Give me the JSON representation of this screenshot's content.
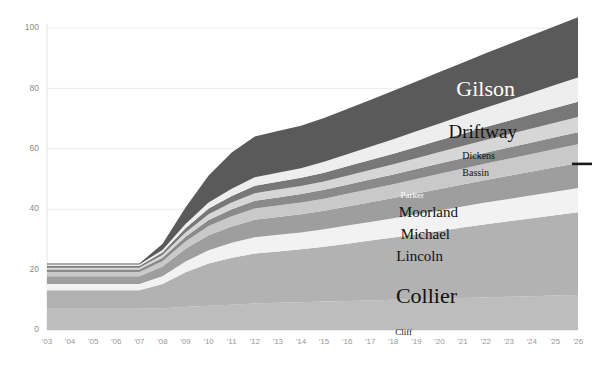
{
  "chart_data": {
    "type": "area",
    "stacked": true,
    "title": "",
    "subtitle": "",
    "xlabel": "",
    "ylabel": "",
    "grid": true,
    "legend_position": "inline-on-bands",
    "ylim": [
      0,
      100
    ],
    "yticks": [
      0,
      20,
      40,
      60,
      80,
      100
    ],
    "ytick_labels": [
      "0",
      "20",
      "40",
      "60",
      "80",
      "100"
    ],
    "categories": [
      "'03",
      "'04",
      "'05",
      "'06",
      "'07",
      "'08",
      "'09",
      "'10",
      "'11",
      "'12",
      "'13",
      "'14",
      "'15",
      "'16",
      "'17",
      "'18",
      "'19",
      "'20",
      "'21",
      "'22",
      "'23",
      "'24",
      "'25",
      "'26"
    ],
    "series": [
      {
        "name": "Cliff",
        "color": "#bdbdbd",
        "values": [
          7.0,
          7.0,
          7.0,
          7.0,
          7.0,
          7.2,
          7.6,
          8.0,
          8.4,
          8.8,
          9.0,
          9.2,
          9.4,
          9.6,
          9.8,
          10.0,
          10.2,
          10.4,
          10.6,
          10.8,
          11.0,
          11.2,
          11.4,
          11.6
        ]
      },
      {
        "name": "Collier",
        "color": "#b2b2b2",
        "values": [
          6.2,
          6.2,
          6.2,
          6.2,
          6.2,
          8.0,
          11.5,
          14.0,
          15.5,
          16.5,
          17.0,
          17.5,
          18.2,
          19.0,
          19.8,
          20.6,
          21.5,
          22.4,
          23.3,
          24.2,
          25.0,
          25.8,
          26.6,
          27.4
        ]
      },
      {
        "name": "Lincoln",
        "color": "#f2f2f2",
        "values": [
          2.0,
          2.0,
          2.0,
          2.0,
          2.0,
          2.6,
          3.6,
          4.4,
          5.0,
          5.4,
          5.5,
          5.6,
          5.8,
          6.0,
          6.2,
          6.4,
          6.6,
          6.8,
          7.0,
          7.2,
          7.4,
          7.6,
          7.8,
          8.0
        ]
      },
      {
        "name": "Michael",
        "color": "#9e9e9e",
        "values": [
          2.6,
          2.6,
          2.6,
          2.6,
          2.6,
          3.2,
          4.2,
          5.0,
          5.4,
          5.8,
          5.9,
          6.0,
          6.1,
          6.3,
          6.5,
          6.7,
          6.9,
          7.1,
          7.3,
          7.5,
          7.7,
          7.9,
          8.1,
          8.3
        ]
      },
      {
        "name": "Moorland",
        "color": "#c9c9c9",
        "values": [
          1.4,
          1.4,
          1.4,
          1.4,
          1.4,
          1.8,
          2.4,
          3.0,
          3.4,
          3.7,
          3.8,
          3.9,
          4.0,
          4.2,
          4.4,
          4.6,
          4.8,
          5.0,
          5.2,
          5.4,
          5.6,
          5.8,
          6.0,
          6.2
        ]
      },
      {
        "name": "Parker",
        "color": "#8a8a8a",
        "values": [
          0.8,
          0.8,
          0.8,
          0.8,
          0.8,
          1.1,
          1.6,
          2.0,
          2.3,
          2.6,
          2.7,
          2.8,
          2.9,
          3.0,
          3.1,
          3.2,
          3.3,
          3.4,
          3.5,
          3.6,
          3.7,
          3.8,
          3.9,
          4.0
        ]
      },
      {
        "name": "Bassin",
        "color": "#d6d6d6",
        "values": [
          0.6,
          0.6,
          0.6,
          0.6,
          0.6,
          0.9,
          1.4,
          1.9,
          2.2,
          2.5,
          2.6,
          2.7,
          2.8,
          3.0,
          3.2,
          3.4,
          3.6,
          3.8,
          4.0,
          4.2,
          4.4,
          4.6,
          4.8,
          5.0
        ]
      },
      {
        "name": "Dickens",
        "color": "#787878",
        "values": [
          0.6,
          0.6,
          0.6,
          0.6,
          0.6,
          0.9,
          1.4,
          1.9,
          2.2,
          2.5,
          2.6,
          2.7,
          2.9,
          3.1,
          3.3,
          3.5,
          3.7,
          3.9,
          4.1,
          4.3,
          4.5,
          4.7,
          4.9,
          5.1
        ]
      },
      {
        "name": "Driftway",
        "color": "#eeeeee",
        "values": [
          0.5,
          0.5,
          0.5,
          0.5,
          0.5,
          0.8,
          1.4,
          2.0,
          2.4,
          2.8,
          3.0,
          3.2,
          3.6,
          4.0,
          4.4,
          4.8,
          5.2,
          5.6,
          6.0,
          6.4,
          6.8,
          7.2,
          7.6,
          8.0
        ]
      },
      {
        "name": "Gilson",
        "color": "#5a5a5a",
        "values": [
          0.3,
          0.3,
          0.3,
          0.3,
          0.3,
          2.0,
          5.5,
          9.0,
          12.0,
          13.5,
          13.8,
          14.0,
          14.5,
          15.0,
          15.5,
          16.0,
          16.5,
          17.0,
          17.5,
          18.0,
          18.5,
          19.0,
          19.5,
          20.0
        ]
      }
    ],
    "totals": [
      22.0,
      22.0,
      22.0,
      22.0,
      22.0,
      29.5,
      41.6,
      51.2,
      58.8,
      62.1,
      63.9,
      65.6,
      68.2,
      71.2,
      74.2,
      77.2,
      80.3,
      83.4,
      86.5,
      89.6,
      92.6,
      95.6,
      98.6,
      103.6
    ],
    "annotations": [
      {
        "name": "Gilson",
        "text": "Gilson",
        "x": 515,
        "y": 96,
        "size": "lbl-huge",
        "tone": "lbl-light",
        "anchor": "end"
      },
      {
        "name": "Driftway",
        "text": "Driftway",
        "x": 517,
        "y": 138,
        "size": "lbl-big",
        "tone": "lbl-dark",
        "anchor": "end"
      },
      {
        "name": "Dickens",
        "text": "Dickens",
        "x": 495,
        "y": 159,
        "size": "lbl-small",
        "tone": "lbl-dark",
        "anchor": "end"
      },
      {
        "name": "Bassin",
        "text": "Bassin",
        "x": 489,
        "y": 176,
        "size": "lbl-small",
        "tone": "lbl-dark",
        "anchor": "end"
      },
      {
        "name": "Parker",
        "text": "Parker",
        "x": 424,
        "y": 198,
        "size": "lbl-tiny",
        "tone": "lbl-light",
        "anchor": "end"
      },
      {
        "name": "Moorland",
        "text": "Moorland",
        "x": 458,
        "y": 217,
        "size": "lbl-mid",
        "tone": "lbl-dark",
        "anchor": "end"
      },
      {
        "name": "Michael",
        "text": "Michael",
        "x": 450,
        "y": 239,
        "size": "lbl-mid",
        "tone": "lbl-dark",
        "anchor": "end"
      },
      {
        "name": "Lincoln",
        "text": "Lincoln",
        "x": 443,
        "y": 261,
        "size": "lbl-mid",
        "tone": "lbl-dark",
        "anchor": "end"
      },
      {
        "name": "Collier",
        "text": "Collier",
        "x": 457,
        "y": 303,
        "size": "lbl-huge",
        "tone": "lbl-dark",
        "anchor": "end"
      },
      {
        "name": "Cliff",
        "text": "Cliff",
        "x": 412,
        "y": 335,
        "size": "lbl-tiny",
        "tone": "lbl-dark",
        "anchor": "end"
      }
    ],
    "right_marker": {
      "name": "right-value-marker",
      "value": 55
    }
  }
}
